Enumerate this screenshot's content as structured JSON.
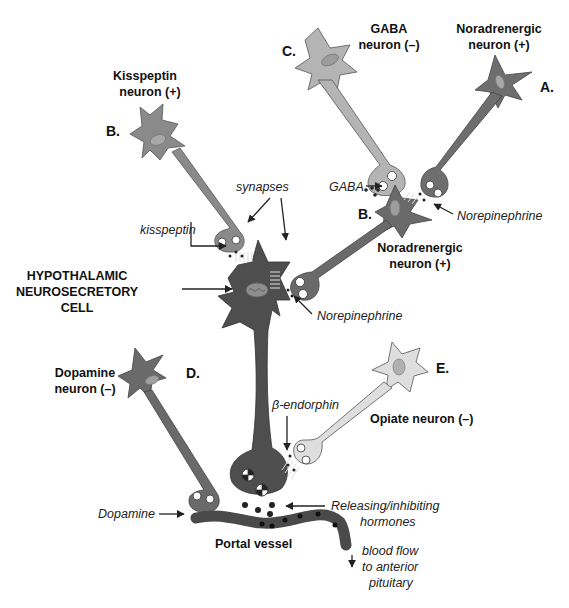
{
  "figure": {
    "colors": {
      "background": "#ffffff",
      "kisspeptin_neuron": "#8a8a8a",
      "gaba_neuron": "#b4b4b4",
      "noradrenergic_neuron_A": "#6e6e6e",
      "noradrenergic_neuron_B": "#6a6a6a",
      "neurosecretory_cell": "#4e4e4e",
      "dopamine_neuron": "#6a6a6a",
      "opiate_neuron": "#dedede",
      "portal_vessel": "#4a4a4a",
      "nucleus": "#9c9c9c",
      "text": "#111111"
    },
    "neurons": {
      "kisspeptin": {
        "letter": "B.",
        "name_line1": "Kisspeptin",
        "name_line2": "neuron (+)"
      },
      "gaba": {
        "letter": "C.",
        "name_line1": "GABA",
        "name_line2": "neuron (–)"
      },
      "noradrenergic_A": {
        "letter": "A.",
        "name_line1": "Noradrenergic",
        "name_line2": "neuron (+)"
      },
      "noradrenergic_B": {
        "letter": "B.",
        "name_line1": "Noradrenergic",
        "name_line2": "neuron (+)"
      },
      "neurosecretory": {
        "name_line1": "HYPOTHALAMIC",
        "name_line2": "NEUROSECRETORY",
        "name_line3": "CELL"
      },
      "dopamine": {
        "letter": "D.",
        "name_line1": "Dopamine",
        "name_line2": "neuron (–)"
      },
      "opiate": {
        "letter": "E.",
        "name": "Opiate neuron (–)"
      }
    },
    "annotations": {
      "synapses": "synapses",
      "kisspeptin": "kisspeptin",
      "gaba": "GABA",
      "norepinephrine_upper": "Norepinephrine",
      "norepinephrine_lower": "Norepinephrine",
      "beta_endorphin": "β-endorphin",
      "dopamine": "Dopamine",
      "releasing_line1": "Releasing/inhibiting",
      "releasing_line2": "hormones",
      "portal_vessel": "Portal vessel",
      "blood_flow_line1": "blood flow",
      "blood_flow_line2": "to anterior",
      "blood_flow_line3": "pituitary"
    }
  }
}
